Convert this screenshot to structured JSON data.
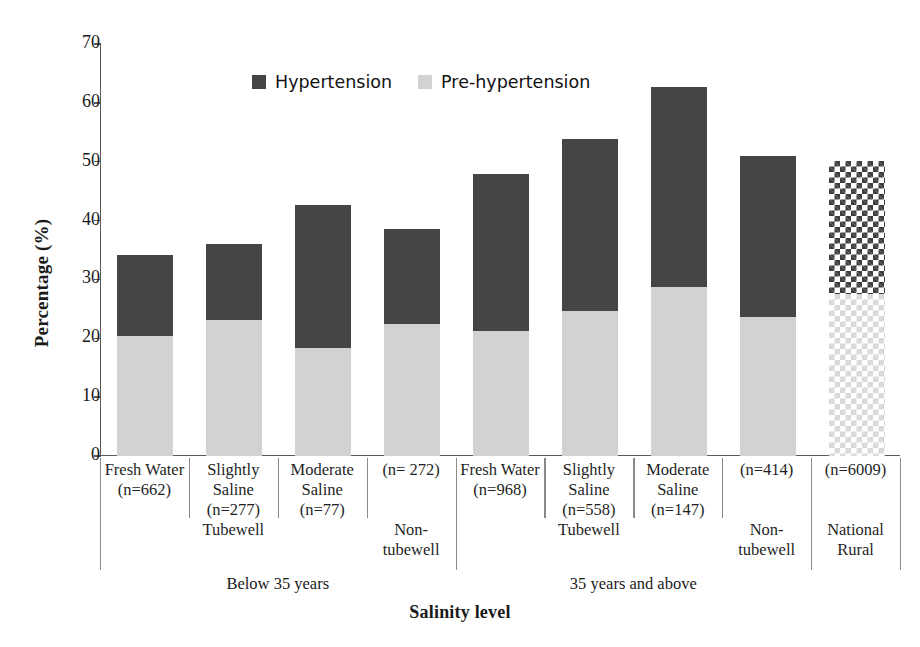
{
  "chart_data": {
    "type": "bar",
    "subtype": "stacked-bar",
    "title": "",
    "xlabel": "Salinity level",
    "ylabel": "Percentage (%)",
    "ylim": [
      0,
      70
    ],
    "ytick_values": [
      0,
      10,
      20,
      30,
      40,
      50,
      60,
      70
    ],
    "ytick_labels": [
      "0",
      "10",
      "20",
      "30",
      "40",
      "50",
      "60",
      "70"
    ],
    "grid": false,
    "legend_position": "top-center",
    "legend": [
      {
        "label": "Hypertension",
        "color": "#454545"
      },
      {
        "label": "Pre-hypertension",
        "color": "#d2d2d2"
      }
    ],
    "series": [
      {
        "name": "Pre-hypertension",
        "color": "#d2d2d2",
        "values": [
          20.4,
          23.1,
          18.4,
          22.4,
          21.3,
          24.6,
          28.8,
          23.7,
          27.6
        ]
      },
      {
        "name": "Hypertension",
        "color": "#454545",
        "values": [
          13.8,
          13.0,
          24.2,
          16.2,
          26.7,
          29.3,
          33.9,
          27.2,
          22.6
        ]
      }
    ],
    "totals": [
      34.2,
      36.1,
      42.6,
      38.6,
      48.0,
      53.9,
      62.7,
      50.9,
      50.2
    ],
    "categories": [
      {
        "name": "Fresh Water\n(n=662)",
        "line1": "Fresh Water",
        "line2": "(n=662)",
        "pattern": "solid",
        "sub": "Tubewell",
        "group": "Below 35 years"
      },
      {
        "name": "Slightly Saline\n(n=277)",
        "line1": "Slightly",
        "line2": "Saline",
        "line3": "(n=277)",
        "pattern": "solid",
        "sub": "Tubewell",
        "group": "Below 35 years"
      },
      {
        "name": "Moderate Saline\n(n=77)",
        "line1": "Moderate",
        "line2": "Saline",
        "line3": "(n=77)",
        "pattern": "solid",
        "sub": "Tubewell",
        "group": "Below 35 years"
      },
      {
        "name": "(n= 272)",
        "line1": "(n= 272)",
        "pattern": "solid",
        "sub": "Non-\ntubewell",
        "group": "Below 35 years"
      },
      {
        "name": "Fresh Water\n(n=968)",
        "line1": "Fresh Water",
        "line2": "(n=968)",
        "pattern": "solid",
        "sub": "Tubewell",
        "group": "35 years and above"
      },
      {
        "name": "Slightly Saline\n(n=558)",
        "line1": "Slightly",
        "line2": "Saline",
        "line3": "(n=558)",
        "pattern": "solid",
        "sub": "Tubewell",
        "group": "35 years and above"
      },
      {
        "name": "Moderate Saline\n(n=147)",
        "line1": "Moderate",
        "line2": "Saline",
        "line3": "(n=147)",
        "pattern": "solid",
        "sub": "Tubewell",
        "group": "35 years and above"
      },
      {
        "name": "(n=414)",
        "line1": "(n=414)",
        "pattern": "solid",
        "sub": "Non-\ntubewell",
        "group": "35 years and above"
      },
      {
        "name": "National Rural (n=6009)",
        "line1": "(n=6009)",
        "pattern": "checkered",
        "sub": "National\nRural",
        "group": ""
      }
    ],
    "group_labels": [
      "Below 35 years",
      "35 years and above"
    ]
  },
  "axis": {
    "y_title": "Percentage (%)",
    "x_title": "Salinity level",
    "ticks": [
      "70",
      "60",
      "50",
      "40",
      "30",
      "20",
      "10",
      "0"
    ]
  },
  "legend": {
    "hypertension": "Hypertension",
    "pre_hypertension": "Pre-hypertension"
  },
  "columns": [
    {
      "l1": "Fresh Water",
      "l2": "(n=662)",
      "l3": "",
      "sub": "",
      "sub2": ""
    },
    {
      "l1": "Slightly",
      "l2": "Saline",
      "l3": "(n=277)",
      "sub": "Tubewell",
      "sub2": ""
    },
    {
      "l1": "Moderate",
      "l2": "Saline",
      "l3": "(n=77)",
      "sub": "",
      "sub2": ""
    },
    {
      "l1": "(n= 272)",
      "l2": "",
      "l3": "",
      "sub": "Non-",
      "sub2": "tubewell"
    },
    {
      "l1": "Fresh Water",
      "l2": "(n=968)",
      "l3": "",
      "sub": "",
      "sub2": ""
    },
    {
      "l1": "Slightly",
      "l2": "Saline",
      "l3": "(n=558)",
      "sub": "Tubewell",
      "sub2": ""
    },
    {
      "l1": "Moderate",
      "l2": "Saline",
      "l3": "(n=147)",
      "sub": "",
      "sub2": ""
    },
    {
      "l1": "(n=414)",
      "l2": "",
      "l3": "",
      "sub": "Non-",
      "sub2": "tubewell"
    },
    {
      "l1": "(n=6009)",
      "l2": "",
      "l3": "",
      "sub": "National",
      "sub2": "Rural"
    }
  ],
  "groups": [
    {
      "label": "Below 35 years"
    },
    {
      "label": "35 years and above"
    }
  ]
}
